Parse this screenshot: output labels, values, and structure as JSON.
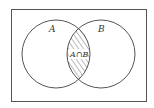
{
  "diagram": {
    "type": "venn",
    "universe": {
      "label": ""
    },
    "sets": [
      {
        "id": "A",
        "label": "A"
      },
      {
        "id": "B",
        "label": "B"
      }
    ],
    "intersection": {
      "label": "A∩B",
      "shaded": true,
      "pattern": "diagonal-hatch"
    },
    "colors": {
      "stroke": "#555555",
      "hatch": "#777777",
      "background": "#ffffff"
    }
  }
}
